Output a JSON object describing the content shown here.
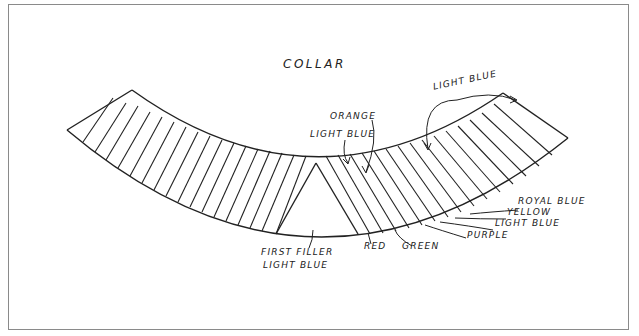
{
  "diagram": {
    "title": "COLLAR",
    "labels": {
      "orange": "ORANGE",
      "light_blue_center": "LIGHT BLUE",
      "light_blue_top_right": "LIGHT BLUE",
      "royal_blue": "ROYAL BLUE",
      "yellow": "YELLOW",
      "light_blue_bottom": "LIGHT BLUE",
      "purple": "PURPLE",
      "green": "GREEN",
      "red": "RED",
      "first_filler_line1": "FIRST FILLER",
      "first_filler_line2": "LIGHT BLUE"
    },
    "colors": {
      "line": "#222222",
      "frame": "#8a8a8a",
      "background": "#ffffff"
    }
  }
}
